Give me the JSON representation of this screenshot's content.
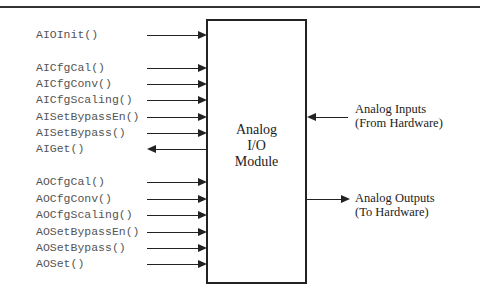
{
  "module": {
    "line1": "Analog",
    "line2": "I/O",
    "line3": "Module"
  },
  "functions": [
    {
      "name": "AIOInit()",
      "y": 35,
      "dir": "in"
    },
    {
      "name": "AICfgCal()",
      "y": 68,
      "dir": "in"
    },
    {
      "name": "AICfgConv()",
      "y": 84,
      "dir": "in"
    },
    {
      "name": "AICfgScaling()",
      "y": 100,
      "dir": "in"
    },
    {
      "name": "AISetBypassEn()",
      "y": 117,
      "dir": "in"
    },
    {
      "name": "AISetBypass()",
      "y": 133,
      "dir": "in"
    },
    {
      "name": "AIGet()",
      "y": 149,
      "dir": "out"
    },
    {
      "name": "AOCfgCal()",
      "y": 182,
      "dir": "in"
    },
    {
      "name": "AOCfgConv()",
      "y": 199,
      "dir": "in"
    },
    {
      "name": "AOCfgScaling()",
      "y": 215,
      "dir": "in"
    },
    {
      "name": "AOSetBypassEn()",
      "y": 232,
      "dir": "in"
    },
    {
      "name": "AOSetBypass()",
      "y": 248,
      "dir": "in"
    },
    {
      "name": "AOSet()",
      "y": 264,
      "dir": "in"
    }
  ],
  "hardware": {
    "inputs": {
      "line1": "Analog Inputs",
      "line2": "(From Hardware)"
    },
    "outputs": {
      "line1": "Analog Outputs",
      "line2": "(To Hardware)"
    }
  }
}
